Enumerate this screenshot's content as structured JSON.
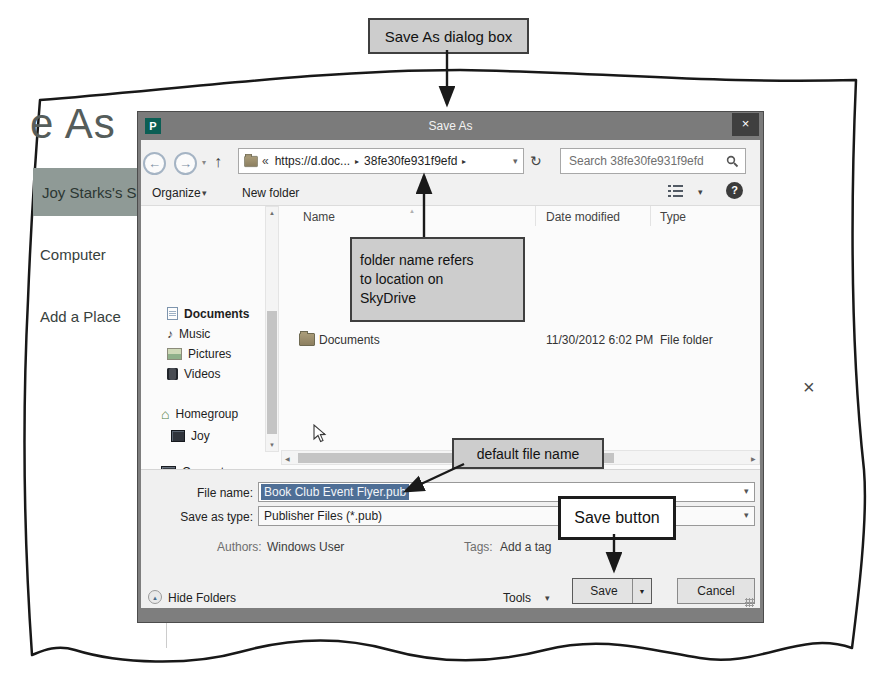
{
  "figure": {
    "callout_dialog": "Save As dialog box",
    "callout_folder_lines": [
      "folder name refers",
      "to location on",
      "SkyDrive"
    ],
    "callout_filename": "default file name",
    "callout_save": "Save button",
    "stray_mark": "×"
  },
  "backstage": {
    "heading_partial": "e As",
    "skydrive_item": "Joy Starks's Sky",
    "computer_item": "Computer",
    "add_place_item": "Add a Place"
  },
  "dialog": {
    "title": "Save As",
    "app_icon_letter": "P",
    "address": {
      "chevrons": "«",
      "root": "https://d.doc...",
      "sep1": "▸",
      "folder": "38fe30fe931f9efd",
      "sep2": "▸"
    },
    "search": {
      "placeholder": "Search 38fe30fe931f9efd"
    },
    "toolbar": {
      "organize": "Organize",
      "new_folder": "New folder"
    },
    "nav": [
      {
        "label": "Documents"
      },
      {
        "label": "Music"
      },
      {
        "label": "Pictures"
      },
      {
        "label": "Videos"
      },
      {
        "label": "Homegroup"
      },
      {
        "label": "Joy"
      },
      {
        "label": "Computer"
      },
      {
        "label": "Local Disk (C:)"
      },
      {
        "label": "Joy (tablet)"
      },
      {
        "label": "Network"
      }
    ],
    "list": {
      "col_name": "Name",
      "col_date": "Date modified",
      "col_type": "Type",
      "row": {
        "name": "Documents",
        "date": "11/30/2012 6:02 PM",
        "type": "File folder"
      }
    },
    "fields": {
      "file_name_label": "File name:",
      "file_name_value": "Book Club Event Flyer.pub",
      "save_type_label": "Save as type:",
      "save_type_value": "Publisher Files (*.pub)",
      "authors_label": "Authors:",
      "authors_value": "Windows User",
      "tags_label": "Tags:",
      "tags_value": "Add a tag"
    },
    "footer": {
      "hide_folders": "Hide Folders",
      "tools": "Tools",
      "save": "Save",
      "cancel": "Cancel"
    }
  },
  "icons": {
    "back": "←",
    "forward": "→",
    "up": "↑",
    "refresh": "↻",
    "dropdown": "▾",
    "split_dropdown": "▼",
    "combo": "▾",
    "help": "?",
    "close": "×",
    "sort": "▲",
    "scroll_up": "▲",
    "scroll_down": "▼",
    "scroll_left": "◀",
    "scroll_right": "▶",
    "hide_folders_arrow": "▲",
    "music_note": "♪",
    "house": "⌂"
  },
  "colors": {
    "titlebar": "#7b7b7b",
    "accent_band": "#8f9a96",
    "selection": "#4f6f96",
    "callout_fill": "#cdcdcd",
    "publisher_brand": "#0b5e54"
  }
}
